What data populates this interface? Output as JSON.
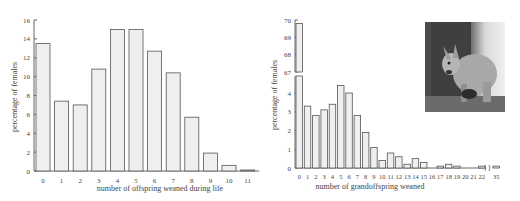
{
  "chart_data": [
    {
      "type": "bar",
      "title": "",
      "xlabel": "number of offspring weaned during life",
      "ylabel": "percentage of females",
      "categories": [
        "0",
        "1",
        "2",
        "3",
        "4",
        "5",
        "6",
        "7",
        "8",
        "9",
        "10",
        "11"
      ],
      "values": [
        13.5,
        7.4,
        7.0,
        10.8,
        15.0,
        15.0,
        12.7,
        10.4,
        5.7,
        1.9,
        0.6,
        0.1
      ],
      "ylim": [
        0,
        16
      ],
      "yticks": [
        0,
        2,
        4,
        6,
        8,
        10,
        12,
        14,
        16
      ],
      "grid": false,
      "bar_color": "#efefef",
      "edge_color": "#555555"
    },
    {
      "type": "bar",
      "title": "",
      "xlabel": "number of grandoffspring weaned",
      "ylabel": "percentage of females",
      "categories": [
        "0",
        "1",
        "2",
        "3",
        "4",
        "5",
        "6",
        "7",
        "8",
        "9",
        "10",
        "11",
        "12",
        "13",
        "14",
        "15",
        "16",
        "17",
        "18",
        "19",
        "20",
        "21",
        "22",
        "35"
      ],
      "values": [
        69.8,
        3.3,
        2.8,
        3.1,
        3.4,
        4.4,
        4.0,
        2.8,
        1.9,
        1.1,
        0.4,
        0.8,
        0.6,
        0.2,
        0.5,
        0.3,
        0.0,
        0.1,
        0.2,
        0.1,
        0.0,
        0.0,
        0.1,
        0.1
      ],
      "ylim": [
        0,
        70
      ],
      "axis_break": {
        "lower": [
          0,
          4.8
        ],
        "upper": [
          67,
          70
        ]
      },
      "yticks_lower": [
        0,
        1,
        2,
        3,
        4
      ],
      "yticks_upper": [
        67,
        68,
        69,
        70
      ],
      "x_axis_break_between": [
        "22",
        "35"
      ],
      "grid": false,
      "bar_color": "#efefef",
      "edge_color": "#555555"
    }
  ],
  "photo": {
    "subject": "kangaroo-photo",
    "alt": "wallaby standing by a tree trunk"
  }
}
